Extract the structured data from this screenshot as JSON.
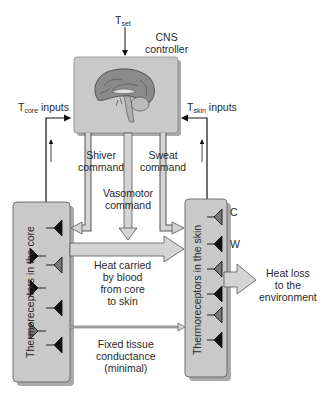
{
  "diagram": {
    "type": "thermoregulation-control-loop",
    "controller": {
      "title_line1": "CNS",
      "title_line2": "controller",
      "setpoint_main": "T",
      "setpoint_sub": "set",
      "icon": "brain-icon"
    },
    "inputs": {
      "core": {
        "main": "T",
        "sub": "core",
        "suffix": " inputs"
      },
      "skin": {
        "main": "T",
        "sub": "skin",
        "suffix": " inputs"
      }
    },
    "commands": {
      "shiver_line1": "Shiver",
      "shiver_line2": "command",
      "vasomotor_line1": "Vasomotor",
      "vasomotor_line2": "command",
      "sweat_line1": "Sweat",
      "sweat_line2": "command"
    },
    "compartments": {
      "core_label": "Thermoreceptors in the core",
      "skin_label": "Thermoreceptors in the skin",
      "receptor_cold": "C",
      "receptor_warm": "W"
    },
    "flows": {
      "blood_line1": "Heat carried",
      "blood_line2": "by blood",
      "blood_line3": "from core",
      "blood_line4": "to skin",
      "conductance_line1": "Fixed tissue",
      "conductance_line2": "conductance",
      "conductance_line3": "(minimal)",
      "loss_line1": "Heat loss",
      "loss_line2": "to the",
      "loss_line3": "environment"
    },
    "colors": {
      "box_fill": "#c9c9c9",
      "box_shadow": "#a8a8a8",
      "receptor_warm": "#111111",
      "receptor_cold": "#777777",
      "pipe_fill": "#d4d4d4",
      "line": "#111111"
    }
  }
}
